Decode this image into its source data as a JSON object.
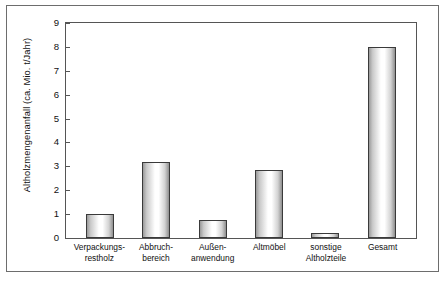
{
  "figure": {
    "caption": ""
  },
  "chart_data": {
    "type": "bar",
    "title": "",
    "xlabel": "",
    "ylabel": "Altholzmengenanfall (ca. Mio. t/Jahr)",
    "categories": [
      "Verpackungs-restholz",
      "Abbruch-bereich",
      "Außen-anwendung",
      "Altmöbel",
      "sonstige Altholzteile",
      "Gesamt"
    ],
    "category_lines": [
      [
        "Verpackungs-",
        "restholz"
      ],
      [
        "Abbruch-",
        "bereich"
      ],
      [
        "Außen-",
        "anwendung"
      ],
      [
        "Altmöbel",
        ""
      ],
      [
        "sonstige",
        "Altholzteile"
      ],
      [
        "Gesamt",
        ""
      ]
    ],
    "values": [
      1.0,
      3.2,
      0.75,
      2.85,
      0.2,
      8.0
    ],
    "ylim": [
      0,
      9
    ],
    "yticks": [
      0,
      1,
      2,
      3,
      4,
      5,
      6,
      7,
      8,
      9
    ],
    "ytick_labels": [
      "0",
      "1",
      "2",
      "3",
      "4",
      "5",
      "6",
      "7",
      "8",
      "9"
    ],
    "grid": false,
    "legend": null,
    "bar_edge_color": "#3a3a3a",
    "bar_fill_color": "#ffffff",
    "axis_color": "#555555",
    "frame_color": "#6d6d6d"
  }
}
